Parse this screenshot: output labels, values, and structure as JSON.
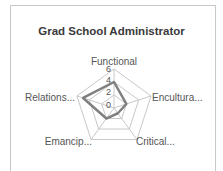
{
  "chart_data": {
    "type": "radar",
    "title": "Grad School Administrator",
    "categories": [
      "Functional",
      "Encultura...",
      "Critical...",
      "Emancip...",
      "Relations..."
    ],
    "series": [
      {
        "name": "Grad School Administrator",
        "values": [
          4,
          2,
          1,
          2,
          5
        ],
        "color": "#808080"
      }
    ],
    "rlim": [
      0,
      6
    ],
    "ticks": [
      "0",
      "2",
      "4",
      "6"
    ],
    "grid": true,
    "legend": "none"
  }
}
